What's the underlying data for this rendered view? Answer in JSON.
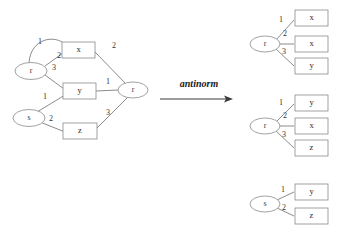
{
  "figure": {
    "operation_label": "antinorm",
    "colors": {
      "stroke": "#6f6f6f",
      "shape_stroke": "#8a8a8a",
      "text": "#2b2b2b",
      "arrow": "#3a3a3a",
      "background": "#ffffff"
    }
  },
  "left_graph": {
    "nodes": [
      {
        "id": "r_left",
        "label": "r",
        "shape": "ellipse",
        "cx": 31,
        "cy": 71,
        "rx": 16,
        "ry": 8.5
      },
      {
        "id": "s_left",
        "label": "s",
        "shape": "ellipse",
        "cx": 29,
        "cy": 118,
        "rx": 16,
        "ry": 8.5
      },
      {
        "id": "r_right",
        "label": "r",
        "shape": "ellipse",
        "cx": 133,
        "cy": 90,
        "rx": 15,
        "ry": 8
      },
      {
        "id": "x_box",
        "label": "x",
        "shape": "rect",
        "x": 62,
        "y": 42,
        "w": 33,
        "h": 16
      },
      {
        "id": "y_box",
        "label": "y",
        "shape": "rect",
        "x": 63,
        "y": 83,
        "w": 33,
        "h": 16
      },
      {
        "id": "z_box",
        "label": "z",
        "shape": "rect",
        "x": 63,
        "y": 123,
        "w": 34,
        "h": 16
      }
    ],
    "edges": [
      {
        "from": "r_left",
        "to": "x_box",
        "label": "1",
        "label_x": 40,
        "label_y": 42,
        "curved": true
      },
      {
        "from": "r_left",
        "to": "x_box",
        "label": "2",
        "label_x": 59,
        "label_y": 56,
        "curved": false
      },
      {
        "from": "r_left",
        "to": "y_box",
        "label": "3",
        "label_x": 54,
        "label_y": 68,
        "curved": false
      },
      {
        "from": "s_left",
        "to": "y_box",
        "label": "1",
        "label_x": 45,
        "label_y": 97,
        "curved": false
      },
      {
        "from": "s_left",
        "to": "z_box",
        "label": "2",
        "label_x": 51,
        "label_y": 119,
        "curved": false
      },
      {
        "from": "x_box",
        "to": "r_right",
        "label": "2",
        "label_x": 114,
        "label_y": 46,
        "curved": false
      },
      {
        "from": "y_box",
        "to": "r_right",
        "label": "1",
        "label_x": 108,
        "label_y": 82,
        "curved": false
      },
      {
        "from": "z_box",
        "to": "r_right",
        "label": "3",
        "label_x": 108,
        "label_y": 113,
        "curved": false
      }
    ]
  },
  "right_trees": [
    {
      "root": {
        "label": "r",
        "cx": 265,
        "cy": 44,
        "rx": 15,
        "ry": 8
      },
      "children": [
        {
          "label": "x",
          "edge_label": "1",
          "x": 295,
          "y": 10,
          "w": 33,
          "h": 16,
          "label_x": 281,
          "label_y": 20
        },
        {
          "label": "x",
          "edge_label": "2",
          "x": 295,
          "y": 36,
          "w": 33,
          "h": 16,
          "label_x": 285,
          "label_y": 34
        },
        {
          "label": "y",
          "edge_label": "3",
          "x": 295,
          "y": 58,
          "w": 33,
          "h": 16,
          "label_x": 284,
          "label_y": 52
        }
      ]
    },
    {
      "root": {
        "label": "r",
        "cx": 265,
        "cy": 126,
        "rx": 15,
        "ry": 8
      },
      "children": [
        {
          "label": "y",
          "edge_label": "1",
          "x": 295,
          "y": 95,
          "w": 33,
          "h": 16,
          "label_x": 281,
          "label_y": 103
        },
        {
          "label": "x",
          "edge_label": "2",
          "x": 295,
          "y": 118,
          "w": 33,
          "h": 16,
          "label_x": 285,
          "label_y": 116
        },
        {
          "label": "z",
          "edge_label": "3",
          "x": 295,
          "y": 140,
          "w": 33,
          "h": 16,
          "label_x": 284,
          "label_y": 135
        }
      ]
    },
    {
      "root": {
        "label": "s",
        "cx": 265,
        "cy": 204,
        "rx": 15,
        "ry": 8
      },
      "children": [
        {
          "label": "y",
          "edge_label": "1",
          "x": 295,
          "y": 184,
          "w": 33,
          "h": 16,
          "label_x": 283,
          "label_y": 190
        },
        {
          "label": "z",
          "edge_label": "2",
          "x": 295,
          "y": 208,
          "w": 33,
          "h": 16,
          "label_x": 284,
          "label_y": 208
        }
      ]
    }
  ],
  "arrow": {
    "label": "antinorm",
    "label_x": 199,
    "label_y": 85,
    "x1": 160,
    "x2": 232,
    "y": 99
  }
}
